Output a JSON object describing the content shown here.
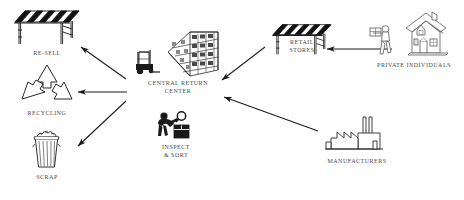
{
  "diagram": {
    "background_color": "#ffffff",
    "line_color": "#1a1a1a",
    "text_color": "#4a4a4a",
    "nodes": [
      {
        "id": "resell",
        "label": "RE-SELL",
        "icon": "market-stall-awning-icon"
      },
      {
        "id": "recycling",
        "label": "RECYCLING",
        "icon": "recycling-symbol-icon"
      },
      {
        "id": "scrap",
        "label": "SCRAP",
        "icon": "trash-can-icon"
      },
      {
        "id": "crc",
        "label": "CENTRAL RETURN\nCENTER",
        "icon": "forklift-warehouse-rack-icon"
      },
      {
        "id": "inspect",
        "label": "INSPECT\n& SORT",
        "icon": "person-inspecting-box-icon"
      },
      {
        "id": "retail",
        "label": "RETAIL\nSTORES",
        "icon": "market-stall-awning-icon"
      },
      {
        "id": "private",
        "label": "PRIVATE INDIVIDUALS",
        "icon": "person-carrying-box-house-icon"
      },
      {
        "id": "manufacturers",
        "label": "MANUFACTURERS",
        "icon": "factory-icon"
      }
    ],
    "arrows": [
      {
        "from": "crc",
        "to": "resell",
        "direction": "up-left"
      },
      {
        "from": "crc",
        "to": "recycling",
        "direction": "left"
      },
      {
        "from": "crc",
        "to": "scrap",
        "direction": "down-left"
      },
      {
        "from": "retail",
        "to": "crc",
        "direction": "down-left"
      },
      {
        "from": "manufacturers",
        "to": "crc",
        "direction": "up-left"
      },
      {
        "from": "private",
        "to": "retail",
        "direction": "left"
      }
    ]
  }
}
